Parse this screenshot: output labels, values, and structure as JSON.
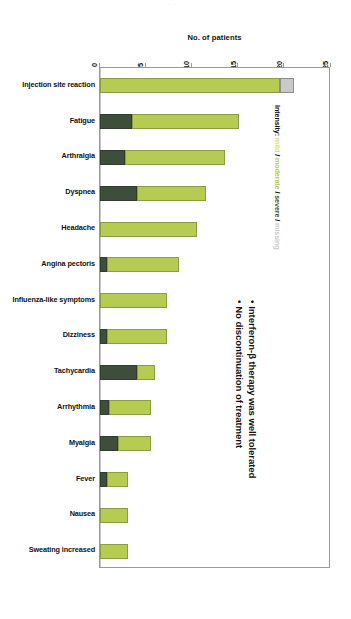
{
  "ghost_header": "· · ·",
  "chart_title": "No. of patients",
  "legend": {
    "title": "Intensity:",
    "mild": "mild",
    "moderate": "moderate",
    "severe": "severe",
    "missing": "missing",
    "separator": " / ",
    "colors": {
      "mild": "#d9e26a",
      "moderate": "#b5cb52",
      "severe": "#3d4f3b",
      "missing": "#c9c9c9"
    }
  },
  "bullets": [
    {
      "marker": "•",
      "text": "Interferon-β therapy was well tolerated"
    },
    {
      "marker": "•",
      "text": "No discontinuation of treatment"
    }
  ],
  "chart_data": {
    "type": "bar",
    "orientation": "horizontal",
    "stacked": true,
    "title": "No. of patients",
    "xlabel": "No. of patients",
    "ylabel": "",
    "xlim": [
      0,
      25
    ],
    "xticks": [
      0,
      5,
      10,
      15,
      20,
      25
    ],
    "xtick_labels": [
      "0",
      "5",
      "10",
      "15",
      "20",
      "25"
    ],
    "grid": false,
    "legend_position": "right-rotated",
    "categories": [
      "Injection site reaction",
      "Fatigue",
      "Arthralgia",
      "Dyspnea",
      "Headache",
      "Angina pectoris",
      "Influenza-like symptoms",
      "Dizziness",
      "Tachycardia",
      "Arrhythmia",
      "Myalgia",
      "Fever",
      "Nausea",
      "Sweating increased"
    ],
    "series": [
      {
        "name": "severe",
        "color": "#3d4f3b",
        "values": [
          0,
          3.5,
          2.7,
          4.0,
          0,
          0.8,
          0,
          0.8,
          4.0,
          1.0,
          2.0,
          0.8,
          0,
          0
        ]
      },
      {
        "name": "moderate",
        "color": "#b5cb52",
        "values": [
          19.5,
          11.5,
          10.8,
          7.5,
          10.5,
          7.7,
          7.3,
          6.5,
          2.0,
          4.5,
          3.5,
          2.2,
          3.0,
          3.0
        ]
      },
      {
        "name": "missing",
        "color": "#c9c9c9",
        "values": [
          1.5,
          0,
          0,
          0,
          0,
          0,
          0,
          0,
          0,
          0,
          0,
          0,
          0,
          0
        ]
      }
    ],
    "totals": [
      21,
      15,
      13.5,
      11.5,
      10.5,
      8.5,
      7.3,
      7.3,
      6,
      5.5,
      5.5,
      3,
      3,
      3
    ]
  }
}
